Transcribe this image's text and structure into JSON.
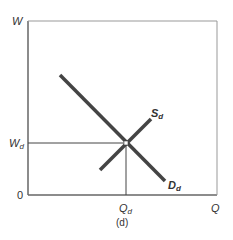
{
  "diagram": {
    "y_axis_label": "W",
    "x_axis_label": "Q",
    "origin_label": "0",
    "wage_label_main": "W",
    "wage_label_sub": "d",
    "quantity_label_main": "Q",
    "quantity_label_sub": "d",
    "supply_label_main": "S",
    "supply_label_sub": "d",
    "demand_label_main": "D",
    "demand_label_sub": "d",
    "caption": "(d)"
  },
  "colors": {
    "axis": "#666666",
    "curve": "#444444",
    "text": "#333333"
  }
}
